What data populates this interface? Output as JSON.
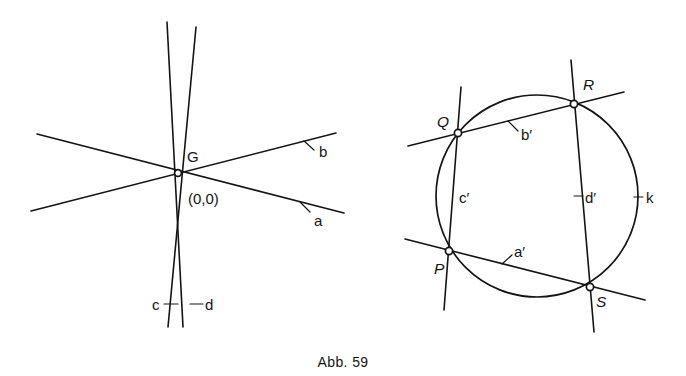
{
  "figure": {
    "caption": "Abb. 59",
    "background_color": "#ffffff",
    "ink_color": "#141414"
  },
  "left_panel": {
    "name": "pencil-of-lines-through-origin",
    "center_point": {
      "label": "G",
      "coordinates_label": "(0,0)",
      "marker": "open-circle"
    },
    "lines": [
      {
        "id": "a",
        "label": "a",
        "orientation": "shallow-descending-to-right"
      },
      {
        "id": "b",
        "label": "b",
        "orientation": "shallow-ascending-to-right"
      },
      {
        "id": "c",
        "label": "c",
        "orientation": "steep-near-vertical-left"
      },
      {
        "id": "d",
        "label": "d",
        "orientation": "steep-near-vertical-right"
      }
    ]
  },
  "right_panel": {
    "name": "circle-with-four-chord-lines",
    "circle": {
      "label": "k"
    },
    "points": [
      {
        "label": "P",
        "marker": "open-circle"
      },
      {
        "label": "Q",
        "marker": "open-circle"
      },
      {
        "label": "R",
        "marker": "open-circle"
      },
      {
        "label": "S",
        "marker": "open-circle"
      }
    ],
    "lines": [
      {
        "id": "a-prime",
        "label": "a′",
        "through": "P-S"
      },
      {
        "id": "b-prime",
        "label": "b′",
        "through": "Q-R"
      },
      {
        "id": "c-prime",
        "label": "c′",
        "through": "Q-P"
      },
      {
        "id": "d-prime",
        "label": "d′",
        "through": "R-S"
      }
    ]
  }
}
